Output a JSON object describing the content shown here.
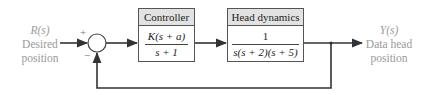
{
  "input": {
    "symbol": "R(s)",
    "line1": "Desired",
    "line2": "position"
  },
  "output": {
    "symbol": "Y(s)",
    "line1": "Data head",
    "line2": "position"
  },
  "summing_junction": {
    "plus_sign": "+",
    "minus_sign": "−"
  },
  "blocks": [
    {
      "title": "Controller",
      "numerator": "K(s + a)",
      "denominator": "s + 1"
    },
    {
      "title": "Head dynamics",
      "numerator": "1",
      "denominator": "s(s + 2)(s + 5)"
    }
  ],
  "colors": {
    "line": "#333333",
    "header_fill": "#e2e2e2",
    "label_text": "#9a9a9a"
  }
}
